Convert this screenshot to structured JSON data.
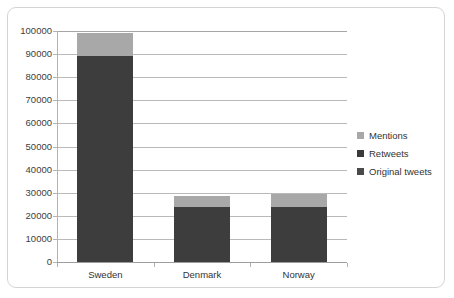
{
  "chart_data": {
    "type": "bar",
    "subtype": "stacked",
    "title": "",
    "xlabel": "",
    "ylabel": "",
    "categories": [
      "Sweden",
      "Denmark",
      "Norway"
    ],
    "series": [
      {
        "name": "Original tweets",
        "values": [
          0,
          0,
          0
        ],
        "color": "#4d4d4d"
      },
      {
        "name": "Retweets",
        "values": [
          89000,
          24000,
          24000
        ],
        "color": "#3d3d3d"
      },
      {
        "name": "Mentions",
        "values": [
          10000,
          4500,
          5500
        ],
        "color": "#a8a8a8"
      }
    ],
    "totals": [
      99000,
      28500,
      29500
    ],
    "ylim": [
      0,
      100000
    ],
    "yticks": [
      0,
      10000,
      20000,
      30000,
      40000,
      50000,
      60000,
      70000,
      80000,
      90000,
      100000
    ],
    "ytick_labels": [
      "0",
      "10000",
      "20000",
      "30000",
      "40000",
      "50000",
      "60000",
      "70000",
      "80000",
      "90000",
      "100000"
    ],
    "grid": true,
    "legend_position": "right"
  },
  "legend": {
    "items": [
      {
        "label": "Mentions",
        "color": "#a8a8a8"
      },
      {
        "label": "Retweets",
        "color": "#3a3a3a"
      },
      {
        "label": "Original tweets",
        "color": "#4a4a4a"
      }
    ]
  },
  "colors": {
    "mentions": "#a8a8a8",
    "retweets": "#3d3d3d",
    "original_tweets": "#4a4a4a",
    "gridline": "#b9b9b9",
    "axis": "#9d9d9d",
    "frame": "#d4d4d4",
    "text": "#333333",
    "background": "#ffffff"
  }
}
